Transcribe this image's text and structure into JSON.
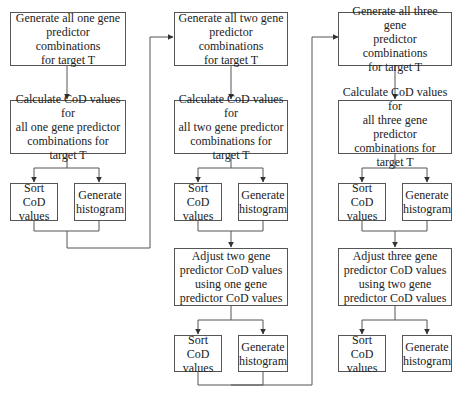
{
  "colors": {
    "line": "#555555",
    "text": "#222222",
    "background": "#ffffff"
  },
  "columns": [
    {
      "name": "one-gene",
      "generate": "Generate all one gene\npredictor combinations\nfor target T",
      "calculate": "Calculate CoD values for\nall one gene predictor\ncombinations for target T",
      "sort": "Sort CoD\nvalues",
      "histogram": "Generate\nhistogram"
    },
    {
      "name": "two-gene",
      "generate": "Generate all two gene\npredictor combinations\nfor target T",
      "calculate": "Calculate CoD values for\nall two gene predictor\ncombinations for target T",
      "sort": "Sort CoD\nvalues",
      "histogram": "Generate\nhistogram",
      "adjust": "Adjust two gene\npredictor CoD values\nusing one gene\npredictor CoD values",
      "sort2": "Sort CoD\nvalues",
      "histogram2": "Generate\nhistogram"
    },
    {
      "name": "three-gene",
      "generate": "Generate all three gene\npredictor combinations\nfor target T",
      "calculate": "Calculate CoD values for\nall three gene predictor\ncombinations for target T",
      "sort": "Sort CoD\nvalues",
      "histogram": "Generate\nhistogram",
      "adjust": "Adjust three gene\npredictor CoD values\nusing two gene\npredictor CoD values",
      "sort2": "Sort CoD\nvalues",
      "histogram2": "Generate\nhistogram"
    }
  ]
}
